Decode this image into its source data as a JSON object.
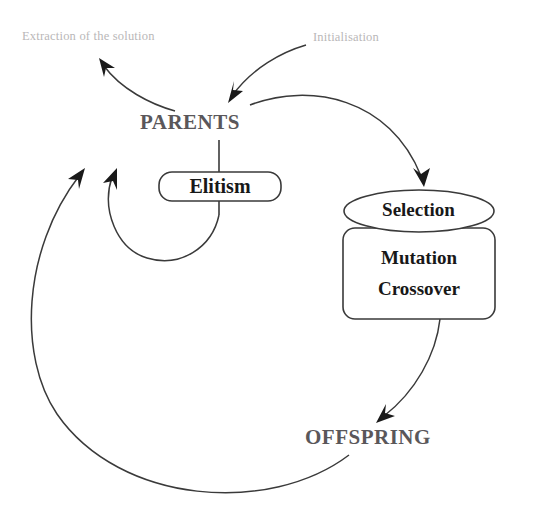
{
  "diagram": {
    "colors": {
      "stroke": "#3a3a3a",
      "node_text": "#5a575a",
      "annotation_text": "#b9b7b8",
      "box_text": "#181818",
      "background": "#ffffff"
    },
    "nodes": {
      "parents": "PARENTS",
      "offspring": "OFFSPRING",
      "elitism": "Elitism",
      "selection": "Selection",
      "mutation": "Mutation",
      "crossover": "Crossover"
    },
    "annotations": {
      "extraction": "Extraction of the solution",
      "initialisation": "Initialisation"
    },
    "edges": [
      {
        "name": "initialisation-to-parents",
        "from": "Initialisation",
        "to": "PARENTS",
        "arrow": true
      },
      {
        "name": "parents-to-extraction",
        "from": "PARENTS",
        "to": "Extraction of the solution",
        "arrow": true
      },
      {
        "name": "parents-to-selection",
        "from": "PARENTS",
        "to": "Selection",
        "arrow": true
      },
      {
        "name": "variation-to-offspring",
        "from": "Mutation / Crossover",
        "to": "OFFSPRING",
        "arrow": true
      },
      {
        "name": "offspring-to-parents",
        "from": "OFFSPRING",
        "to": "PARENTS",
        "arrow": true
      },
      {
        "name": "elitism-to-parents",
        "from": "Elitism",
        "to": "PARENTS",
        "arrow": true
      },
      {
        "name": "parents-to-elitism",
        "from": "PARENTS",
        "to": "Elitism",
        "arrow": false
      }
    ]
  }
}
